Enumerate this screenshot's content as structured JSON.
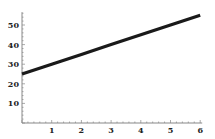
{
  "chart_data": {
    "type": "line",
    "title": "",
    "xlabel": "",
    "ylabel": "",
    "xlim": [
      0,
      6
    ],
    "ylim": [
      0,
      55
    ],
    "grid": false,
    "legend": null,
    "x_ticks": [
      1,
      2,
      3,
      4,
      5,
      6
    ],
    "y_ticks": [
      10,
      20,
      30,
      40,
      50
    ],
    "series": [
      {
        "name": "line",
        "x": [
          0,
          1,
          2,
          3,
          4,
          5,
          6
        ],
        "values": [
          25,
          30,
          35,
          40,
          45,
          50,
          55
        ],
        "color": "#1a1a1a"
      }
    ]
  },
  "layout": {
    "axis_color": "#888888",
    "origin_px": [
      22,
      123
    ],
    "x_px_per_unit": 29.7,
    "y_px_per_unit": 1.96
  }
}
